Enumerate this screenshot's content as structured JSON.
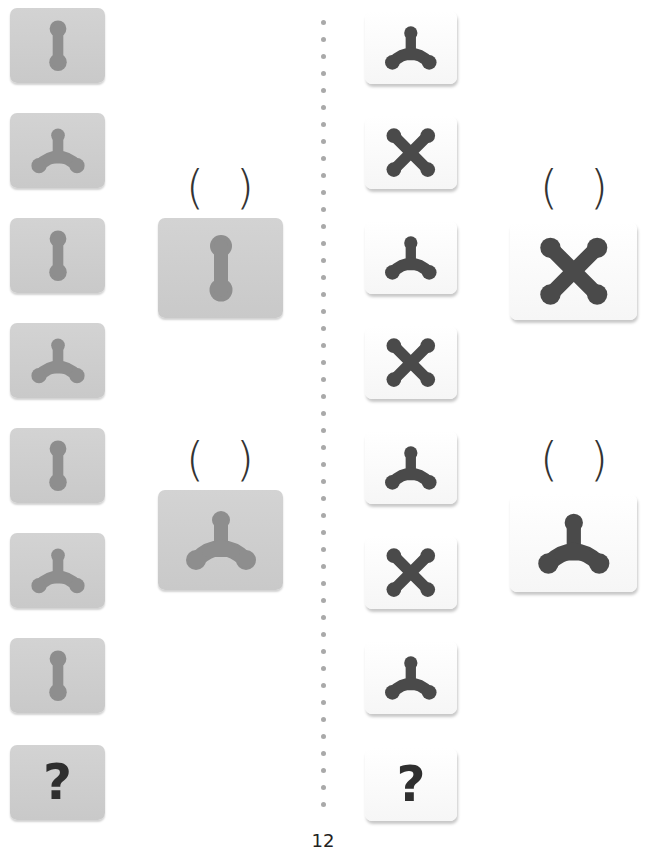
{
  "page": {
    "page_number": "12"
  },
  "colors": {
    "gray_tile": "#cecece",
    "gray_shape": "#8e8e8e",
    "white_tile": "#fbfbfb",
    "dark_shape": "#4a4a4a",
    "divider_dot": "#a9a9a9"
  },
  "left_puzzle": {
    "sequence": [
      "bar",
      "tri",
      "bar",
      "tri",
      "bar",
      "tri",
      "bar",
      "?"
    ],
    "question_mark": "?",
    "options": [
      {
        "shape": "bar",
        "answer_blank": "(   )",
        "open": "(",
        "close": ")"
      },
      {
        "shape": "tri",
        "answer_blank": "(   )",
        "open": "(",
        "close": ")"
      }
    ]
  },
  "right_puzzle": {
    "sequence": [
      "tri",
      "x",
      "tri",
      "x",
      "tri",
      "x",
      "tri",
      "?"
    ],
    "question_mark": "?",
    "options": [
      {
        "shape": "x",
        "answer_blank": "(   )",
        "open": "(",
        "close": ")"
      },
      {
        "shape": "tri",
        "answer_blank": "(   )",
        "open": "(",
        "close": ")"
      }
    ]
  }
}
